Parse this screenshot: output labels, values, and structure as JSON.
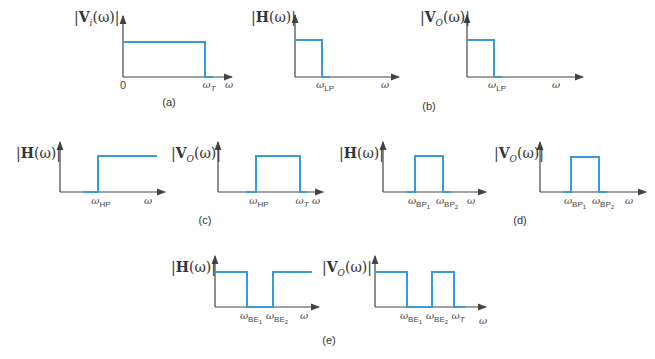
{
  "colors": {
    "signal": "#3a9ad9",
    "axis": "#444444"
  },
  "panels": {
    "a": {
      "caption": "(a)",
      "ylabel": {
        "bold": "V",
        "sub": "i",
        "rest": "(ω)"
      },
      "ticks": {
        "zero": "0",
        "wT": "T",
        "w": "ω"
      }
    },
    "b": {
      "caption": "(b)",
      "h_ylabel": {
        "bold": "H",
        "rest": "(ω)"
      },
      "v_ylabel": {
        "bold": "V",
        "sub": "O",
        "rest": "(ω)"
      },
      "ticks": {
        "wLP": "LP",
        "w": "ω"
      }
    },
    "c": {
      "caption": "(c)",
      "h_ylabel": {
        "bold": "H",
        "rest": "(ω)"
      },
      "v_ylabel": {
        "bold": "V",
        "sub": "O",
        "rest": "(ω)"
      },
      "ticks": {
        "wHP": "HP",
        "wT": "T",
        "w": "ω"
      }
    },
    "d": {
      "caption": "(d)",
      "h_ylabel": {
        "bold": "H",
        "rest": "(ω)"
      },
      "v_ylabel": {
        "bold": "V",
        "sub": "O",
        "rest": "(ω)"
      },
      "ticks": {
        "BP": "BP",
        "one": "1",
        "two": "2",
        "w": "ω"
      }
    },
    "e": {
      "caption": "(e)",
      "h_ylabel": {
        "bold": "H",
        "rest": "(ω)"
      },
      "v_ylabel": {
        "bold": "V",
        "sub": "O",
        "rest": "(ω)"
      },
      "ticks": {
        "BE": "BE",
        "one": "1",
        "two": "2",
        "wT": "T",
        "w": "ω"
      }
    }
  },
  "omega": "ω",
  "bar": "|"
}
